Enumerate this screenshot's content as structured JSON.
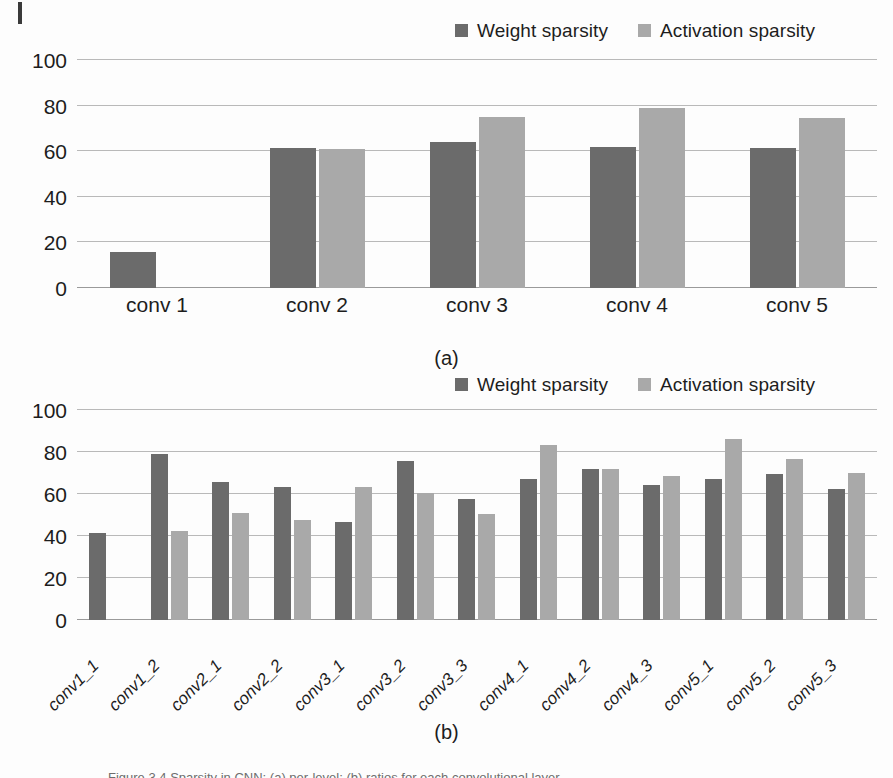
{
  "figure": {
    "corner_mark": "registration-mark",
    "subcaption_a": "(a)",
    "subcaption_b": "(b)",
    "caption_partial": "Figure 3.4  Sparsity in CNN: (a) per-level; (b) ratios for each convolutional layer"
  },
  "legend": {
    "items": [
      {
        "label": "Weight sparsity",
        "color": "#6b6b6b"
      },
      {
        "label": "Activation sparsity",
        "color": "#a9a9a9"
      }
    ]
  },
  "colors": {
    "weight_sparsity": "#6b6b6b",
    "activation_sparsity": "#a9a9a9",
    "gridline": "#b9b9b9",
    "axis": "#9a9a9a",
    "text": "#1d1d1d",
    "background": "#fdfdfd"
  },
  "chart_data": [
    {
      "id": "chart-a",
      "type": "bar",
      "title": "",
      "subcaption": "(a)",
      "xlabel": "",
      "ylabel": "",
      "ylim": [
        0,
        100
      ],
      "yticks": [
        0,
        20,
        40,
        60,
        80,
        100
      ],
      "grid": true,
      "legend_position": "top-right",
      "categories": [
        "conv 1",
        "conv 2",
        "conv 3",
        "conv 4",
        "conv 5"
      ],
      "series": [
        {
          "name": "Weight sparsity",
          "color": "#6b6b6b",
          "values": [
            16,
            61.5,
            64,
            62,
            61.5
          ]
        },
        {
          "name": "Activation sparsity",
          "color": "#a9a9a9",
          "values": [
            null,
            61,
            75,
            79,
            74.5
          ]
        }
      ]
    },
    {
      "id": "chart-b",
      "type": "bar",
      "title": "",
      "subcaption": "(b)",
      "xlabel": "",
      "ylabel": "",
      "ylim": [
        0,
        100
      ],
      "yticks": [
        0,
        20,
        40,
        60,
        80,
        100
      ],
      "grid": true,
      "legend_position": "top-right",
      "categories": [
        "conv1_1",
        "conv1_2",
        "conv2_1",
        "conv2_2",
        "conv3_1",
        "conv3_2",
        "conv3_3",
        "conv4_1",
        "conv4_2",
        "conv4_3",
        "conv5_1",
        "conv5_2",
        "conv5_3"
      ],
      "series": [
        {
          "name": "Weight sparsity",
          "color": "#6b6b6b",
          "values": [
            41.5,
            79,
            65.5,
            63.5,
            46.5,
            75.5,
            57.5,
            67,
            72,
            64.5,
            67,
            69.5,
            62.5
          ]
        },
        {
          "name": "Activation sparsity",
          "color": "#a9a9a9",
          "values": [
            null,
            42.5,
            51,
            47.5,
            63.5,
            60.5,
            50.5,
            83.5,
            72,
            68.5,
            86,
            76.5,
            70
          ]
        }
      ]
    }
  ]
}
